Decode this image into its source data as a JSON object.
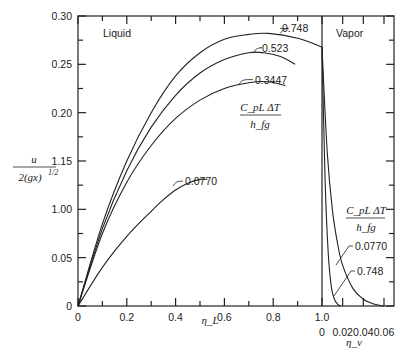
{
  "chart_data": {
    "type": "line",
    "title": "",
    "ylabel": "u / 2(gx)^(1/2)",
    "ylabel_numerator": "u",
    "ylabel_denominator": "2(gx)",
    "ylabel_exponent": "1/2",
    "xlabel_liquid": "η_L",
    "xlabel_vapor": "η_v",
    "region_labels": {
      "liquid": "Liquid",
      "vapor": "Vapor"
    },
    "parameter_label": {
      "numerator": "C_pL ΔT",
      "denominator": "h_fg"
    },
    "y_ticks": [
      "0",
      "0.05",
      "1.00",
      "1.15",
      "0.20",
      "0.25",
      "0.30"
    ],
    "y_tick_values": [
      0,
      0.05,
      0.1,
      0.15,
      0.2,
      0.25,
      0.3
    ],
    "x_ticks_liquid": [
      "0",
      "0.2",
      "0.4",
      "0.6",
      "0.8",
      "1.0"
    ],
    "x_ticks_vapor": [
      "0",
      "0.02",
      "0.04",
      "0.06"
    ],
    "ylim": [
      0,
      0.3
    ],
    "xlim_liquid": [
      0,
      1.0
    ],
    "xlim_vapor": [
      0,
      0.06
    ],
    "grid": false,
    "series_liquid": [
      {
        "name": "0.748",
        "x": [
          0,
          0.1,
          0.2,
          0.3,
          0.4,
          0.5,
          0.6,
          0.7,
          0.78,
          0.9,
          1.0
        ],
        "y": [
          0,
          0.085,
          0.15,
          0.2,
          0.238,
          0.262,
          0.276,
          0.281,
          0.282,
          0.277,
          0.268
        ]
      },
      {
        "name": "0.523",
        "x": [
          0,
          0.1,
          0.2,
          0.3,
          0.4,
          0.5,
          0.6,
          0.7,
          0.76,
          0.83,
          0.89
        ],
        "y": [
          0,
          0.08,
          0.14,
          0.185,
          0.218,
          0.241,
          0.255,
          0.262,
          0.262,
          0.258,
          0.25
        ]
      },
      {
        "name": "0.3447",
        "x": [
          0,
          0.1,
          0.2,
          0.3,
          0.4,
          0.5,
          0.6,
          0.7,
          0.78,
          0.85
        ],
        "y": [
          0,
          0.075,
          0.128,
          0.166,
          0.194,
          0.213,
          0.225,
          0.231,
          0.232,
          0.228
        ]
      },
      {
        "name": "0.0770",
        "x": [
          0,
          0.1,
          0.2,
          0.3,
          0.35,
          0.4,
          0.45,
          0.5,
          0.53
        ],
        "y": [
          0,
          0.04,
          0.072,
          0.098,
          0.11,
          0.12,
          0.127,
          0.131,
          0.131
        ]
      }
    ],
    "series_vapor": [
      {
        "name": "0.0770",
        "x": [
          0,
          0.005,
          0.01,
          0.015,
          0.02,
          0.03,
          0.04,
          0.05,
          0.06
        ],
        "y": [
          0.268,
          0.16,
          0.1,
          0.065,
          0.042,
          0.018,
          0.007,
          0.002,
          0
        ]
      },
      {
        "name": "0.748",
        "x": [
          0,
          0.003,
          0.006,
          0.009,
          0.012,
          0.015,
          0.018
        ],
        "y": [
          0.268,
          0.13,
          0.055,
          0.02,
          0.007,
          0.002,
          0
        ]
      }
    ]
  }
}
